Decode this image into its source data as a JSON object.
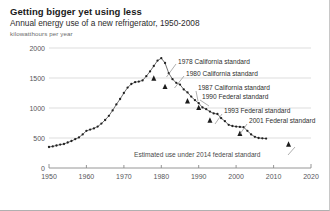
{
  "header": {
    "title": "Getting bigger yet using less",
    "subtitle": "Annual energy use of a new refrigerator, 1950-2008",
    "unit_label": "kilowatthours per year"
  },
  "chart_data": {
    "type": "line",
    "title": "Getting bigger yet using less",
    "subtitle": "Annual energy use of a new refrigerator, 1950-2008",
    "xlabel": "",
    "ylabel": "kilowatthours per year",
    "xlim": [
      1950,
      2020
    ],
    "ylim": [
      0,
      2000
    ],
    "grid": "horizontal",
    "legend": "none",
    "xticks": [
      1950,
      1960,
      1970,
      1980,
      1990,
      2000,
      2010,
      2020
    ],
    "yticks": [
      0,
      500,
      1000,
      1500,
      2000
    ],
    "series": [
      {
        "name": "Annual energy use of a new refrigerator",
        "marker": "dot",
        "x": [
          1950,
          1951,
          1952,
          1953,
          1954,
          1955,
          1956,
          1957,
          1958,
          1959,
          1960,
          1961,
          1962,
          1963,
          1964,
          1965,
          1966,
          1967,
          1968,
          1969,
          1970,
          1971,
          1972,
          1973,
          1974,
          1975,
          1976,
          1977,
          1978,
          1979,
          1980,
          1981,
          1982,
          1983,
          1984,
          1985,
          1986,
          1987,
          1988,
          1989,
          1990,
          1991,
          1992,
          1993,
          1994,
          1995,
          1996,
          1997,
          1998,
          1999,
          2000,
          2001,
          2002,
          2003,
          2004,
          2005,
          2006,
          2007,
          2008
        ],
        "values": [
          350,
          360,
          375,
          390,
          400,
          425,
          450,
          480,
          510,
          560,
          620,
          640,
          660,
          690,
          740,
          800,
          870,
          960,
          1060,
          1150,
          1250,
          1340,
          1400,
          1430,
          1440,
          1460,
          1530,
          1610,
          1700,
          1790,
          1830,
          1750,
          1580,
          1480,
          1420,
          1390,
          1310,
          1260,
          1190,
          1130,
          1080,
          1010,
          980,
          940,
          910,
          900,
          830,
          780,
          720,
          700,
          690,
          685,
          680,
          620,
          560,
          520,
          500,
          495,
          490
        ]
      }
    ],
    "markers": [
      {
        "label": "1978 California standard",
        "year": 1978,
        "value": 1500
      },
      {
        "label": "1980 California standard",
        "year": 1981,
        "value": 1360
      },
      {
        "label": "1987 California standard",
        "year": 1987,
        "value": 1120
      },
      {
        "label": "1990 Federal standard",
        "year": 1990,
        "value": 1010
      },
      {
        "label": "1993 Federal standard",
        "year": 1993,
        "value": 800
      },
      {
        "label": "2001 Federal standard",
        "year": 2001,
        "value": 580
      },
      {
        "label": "Estimated use under 2014 federal standard",
        "year": 2014,
        "value": 400
      }
    ],
    "annotations": [
      {
        "text": "1978 California standard"
      },
      {
        "text": "1980 California standard"
      },
      {
        "text": "1987 California standard"
      },
      {
        "text": "1990 Federal standard"
      },
      {
        "text": "1993 Federal standard"
      },
      {
        "text": "2001 Federal standard"
      },
      {
        "text": "Estimated use under 2014 federal standard"
      }
    ],
    "colors": {
      "line": "#3a3a3a",
      "marker": "#222222",
      "grid": "#d9d9d9",
      "axis": "#808080",
      "text": "#2f2f2f"
    }
  },
  "yticks": {
    "t0": "0",
    "t1": "500",
    "t2": "1000",
    "t3": "1500",
    "t4": "2000"
  },
  "xticks": {
    "t0": "1950",
    "t1": "1960",
    "t2": "1970",
    "t3": "1980",
    "t4": "1990",
    "t5": "2000",
    "t6": "2010",
    "t7": "2020"
  },
  "annotations": {
    "a0": "1978 California standard",
    "a1": "1980 California standard",
    "a2": "1987 California standard",
    "a3": "1990 Federal standard",
    "a4": "1993 Federal standard",
    "a5": "2001 Federal standard",
    "a6": "Estimated use under 2014 federal standard"
  }
}
